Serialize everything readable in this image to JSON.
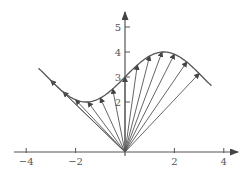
{
  "chart_data": {
    "type": "line",
    "title": "",
    "xlabel": "",
    "ylabel": "",
    "xlim": [
      -4,
      4
    ],
    "ylim": [
      0,
      5
    ],
    "x_ticks": [
      -4,
      -2,
      0,
      2,
      4
    ],
    "x_tick_labels": [
      "-4",
      "-2",
      "",
      "2",
      "4"
    ],
    "y_ticks": [
      2,
      3,
      4,
      5
    ],
    "y_tick_labels": [
      "2",
      "3",
      "4",
      "5"
    ],
    "grid": false,
    "legend": null,
    "curve": {
      "name": "y = 3 + sin(x)",
      "x_range": [
        -3.5,
        3.5
      ],
      "color": "#555555"
    },
    "vectors": {
      "origin": [
        0,
        0
      ],
      "x_endpoints": [
        -3,
        -2.5,
        -2,
        -1.5,
        -1,
        -0.5,
        0,
        0.5,
        1,
        1.5,
        2,
        2.5,
        3
      ],
      "y_endpoints": [
        2.86,
        2.4,
        2.09,
        2.0,
        2.16,
        2.52,
        3.0,
        3.48,
        3.84,
        4.0,
        3.91,
        3.6,
        3.14
      ],
      "color": "#555555"
    }
  },
  "style": {
    "axis_color": "#555555",
    "line_color": "#555555"
  }
}
